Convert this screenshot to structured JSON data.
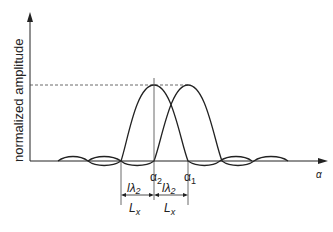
{
  "diagram": {
    "ylabel": "normalized amplitude",
    "xlabel": "α",
    "markers": [
      {
        "id": "alpha2",
        "label": "α",
        "sub": "2"
      },
      {
        "id": "alpha1",
        "label": "α",
        "sub": "1"
      }
    ],
    "spacing": [
      {
        "num": "lλ",
        "num_sub": "2",
        "den": "L",
        "den_sub": "x"
      },
      {
        "num": "lλ",
        "num_sub": "2",
        "den": "L",
        "den_sub": "x"
      }
    ],
    "colors": {
      "line": "#222222",
      "dashed": "#444444",
      "background": "#ffffff"
    }
  }
}
